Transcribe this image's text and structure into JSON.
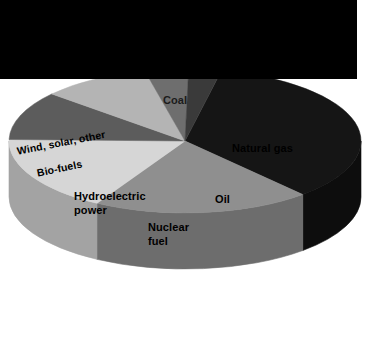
{
  "figure": {
    "title": "",
    "background_color": "#ffffff",
    "banner_color": "#000000",
    "width": 375,
    "height": 360
  },
  "chart_data": {
    "type": "pie",
    "title": "",
    "subtitle": "",
    "xlabel": "",
    "ylabel": "",
    "legend_position": "none",
    "grid": false,
    "style": "3d-pie",
    "labels_inside": true,
    "categories": [
      "Coal",
      "Natural gas",
      "Oil",
      "Nuclear fuel",
      "Hydroelectric power",
      "Bio-fuels",
      "Wind, solar, other"
    ],
    "values": [
      35,
      20,
      17,
      11,
      10,
      4,
      3
    ],
    "units": "percent",
    "colors": [
      "#151515",
      "#8f8f8f",
      "#d6d6d6",
      "#5c5c5c",
      "#b4b4b4",
      "#6e6e6e",
      "#3a3a3a"
    ],
    "side_colors": [
      "#0d0d0d",
      "#6d6d6d",
      "#a3a3a3",
      "#3f3f3f",
      "#868686",
      "#515151",
      "#2a2a2a"
    ],
    "slices": [
      {
        "label": "Coal",
        "value": 35,
        "color": "#151515",
        "side_color": "#0d0d0d"
      },
      {
        "label": "Natural gas",
        "value": 20,
        "color": "#8f8f8f",
        "side_color": "#6d6d6d"
      },
      {
        "label": "Oil",
        "value": 17,
        "color": "#d6d6d6",
        "side_color": "#a3a3a3"
      },
      {
        "label": "Nuclear fuel",
        "value": 11,
        "color": "#5c5c5c",
        "side_color": "#3f3f3f"
      },
      {
        "label": "Hydroelectric power",
        "value": 10,
        "color": "#b4b4b4",
        "side_color": "#868686"
      },
      {
        "label": "Bio-fuels",
        "value": 4,
        "color": "#6e6e6e",
        "side_color": "#515151"
      },
      {
        "label": "Wind, solar, other",
        "value": 3,
        "color": "#3a3a3a",
        "side_color": "#2a2a2a"
      }
    ]
  },
  "labels": {
    "coal": "Coal",
    "natural_gas": "Natural gas",
    "oil": "Oil",
    "nuclear_fuel_line1": "Nuclear",
    "nuclear_fuel_line2": "fuel",
    "hydro_line1": "Hydroelectric",
    "hydro_line2": "power",
    "biofuels": "Bio-fuels",
    "wind_solar_other": "Wind, solar, other"
  }
}
